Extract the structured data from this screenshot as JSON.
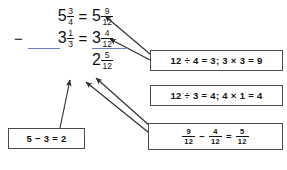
{
  "problem": {
    "line1": {
      "operator": "",
      "left": {
        "whole": "5",
        "num": "3",
        "den": "4"
      },
      "equals": "=",
      "right": {
        "whole": "5",
        "num": "9",
        "den": "12"
      }
    },
    "line2": {
      "operator": "−",
      "left": {
        "whole": "3",
        "num": "1",
        "den": "3"
      },
      "equals": "=",
      "right": {
        "whole": "3",
        "num": "4",
        "den": "12"
      }
    },
    "answer": {
      "whole": "2",
      "num": "5",
      "den": "12"
    }
  },
  "callouts": {
    "top": {
      "text": "12 ÷ 4 = 3; 3 × 3 = 9"
    },
    "middle": {
      "text": "12 ÷ 3 = 4; 4 × 1 = 4"
    },
    "left": {
      "text": "5 − 3 = 2"
    },
    "fraction": {
      "a": {
        "num": "9",
        "den": "12"
      },
      "minus": "−",
      "b": {
        "num": "4",
        "den": "12"
      },
      "equals": "=",
      "result": {
        "num": "5",
        "den": "12"
      }
    }
  },
  "colors": {
    "text": "#111111",
    "box_border": "#4a4a4a",
    "rule_blue": "#6b7ec4",
    "arrow": "#2b2b2b",
    "background": "#ffffff"
  }
}
